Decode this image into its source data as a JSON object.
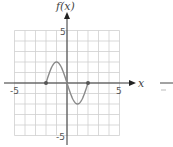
{
  "chart_data": {
    "type": "line",
    "title": "",
    "xlabel": "x",
    "ylabel": "f(x)",
    "xlim": [
      -5,
      5
    ],
    "ylim": [
      -5,
      5
    ],
    "grid": true,
    "x_tick_labels": [
      "-5",
      "5"
    ],
    "y_tick_labels": [
      "5",
      "-5"
    ],
    "series": [
      {
        "name": "f(x)",
        "x": [
          -2,
          -1.5,
          -1,
          -0.5,
          0,
          0.5,
          1,
          1.5,
          2
        ],
        "y": [
          0,
          1.41,
          2,
          1.41,
          0,
          -1.41,
          -2,
          -1.41,
          0
        ],
        "endpoints": [
          [
            -2,
            0
          ],
          [
            2,
            0
          ]
        ]
      }
    ],
    "colors": {
      "grid": "#cfcfcf",
      "axis": "#333333",
      "curve": "#888888",
      "dot": "#555555"
    }
  }
}
